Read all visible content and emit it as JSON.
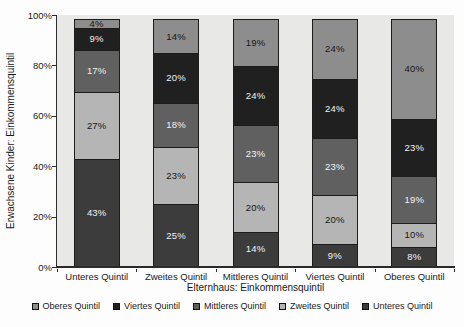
{
  "chart_data": {
    "type": "bar",
    "subtype": "stacked-100",
    "title": "",
    "xlabel": "Elternhaus: Einkommensquintil",
    "ylabel": "Erwachsene Kinder: Einkommensquintil",
    "categories": [
      "Unteres Quintil",
      "Zweites Quintil",
      "Mittleres Quintil",
      "Viertes Quintil",
      "Oberes Quintil"
    ],
    "series": [
      {
        "name": "Unteres Quintil",
        "color": "#3c3c3c",
        "label_color": "#f2f2f2",
        "values": [
          43,
          25,
          14,
          9,
          8
        ]
      },
      {
        "name": "Zweites Quintil",
        "color": "#b5b5b5",
        "label_color": "#161616",
        "values": [
          27,
          23,
          20,
          20,
          10
        ]
      },
      {
        "name": "Mittleres Quintil",
        "color": "#606060",
        "label_color": "#f2f2f2",
        "values": [
          17,
          18,
          23,
          23,
          19
        ]
      },
      {
        "name": "Viertes Quintil",
        "color": "#202020",
        "label_color": "#f2f2f2",
        "values": [
          9,
          20,
          24,
          24,
          23
        ]
      },
      {
        "name": "Oberes Quintil",
        "color": "#8d8d8d",
        "label_color": "#161616",
        "values": [
          4,
          14,
          19,
          24,
          40
        ]
      }
    ],
    "y_ticks": [
      "0%",
      "20%",
      "40%",
      "60%",
      "80%",
      "100%"
    ],
    "ylim": [
      0,
      100
    ],
    "grid": false,
    "data_label_suffix": "%",
    "legend_position": "bottom",
    "legend_order": [
      "Oberes Quintil",
      "Viertes Quintil",
      "Mittleres Quintil",
      "Zweites Quintil",
      "Unteres Quintil"
    ]
  },
  "colors": {
    "plot_background": "#e8e8e7",
    "axis": "#2b2b2b",
    "text": "#1a1a1a",
    "page_background": "#ffffff"
  }
}
